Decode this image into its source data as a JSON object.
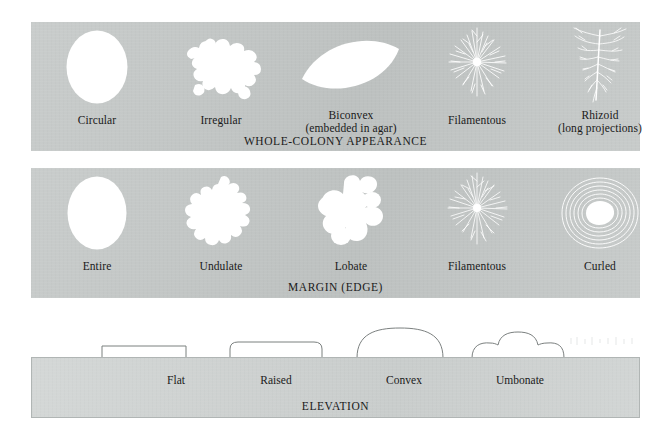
{
  "figure": {
    "background_color": "#ffffff",
    "panel_color": "#c3c7c6",
    "elevation_panel_color": "#cdd1d0",
    "shape_color": "#ffffff",
    "text_color": "#1a1a1a"
  },
  "panels": [
    {
      "id": "whole-colony-appearance",
      "title": "WHOLE-COLONY APPEARANCE",
      "items": [
        {
          "label": "Circular",
          "shape": "circular"
        },
        {
          "label": "Irregular",
          "shape": "irregular"
        },
        {
          "label": "Biconvex\n(embedded in agar)",
          "shape": "biconvex"
        },
        {
          "label": "Filamentous",
          "shape": "filamentous"
        },
        {
          "label": "Rhizoid\n(long projections)",
          "shape": "rhizoid"
        }
      ]
    },
    {
      "id": "margin-edge",
      "title": "MARGIN (EDGE)",
      "items": [
        {
          "label": "Entire",
          "shape": "entire"
        },
        {
          "label": "Undulate",
          "shape": "undulate"
        },
        {
          "label": "Lobate",
          "shape": "lobate"
        },
        {
          "label": "Filamentous",
          "shape": "filamentous"
        },
        {
          "label": "Curled",
          "shape": "curled"
        }
      ]
    },
    {
      "id": "elevation",
      "title": "ELEVATION",
      "items": [
        {
          "label": "Flat",
          "shape": "flat-profile"
        },
        {
          "label": "Raised",
          "shape": "raised-profile"
        },
        {
          "label": "Convex",
          "shape": "convex-profile"
        },
        {
          "label": "Umbonate",
          "shape": "umbonate-profile"
        }
      ]
    }
  ]
}
